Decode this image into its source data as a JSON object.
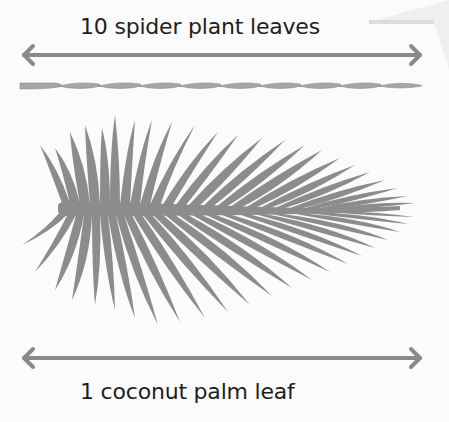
{
  "diagram": {
    "top": {
      "label": "10 spider plant leaves",
      "leaf_count": 10
    },
    "bottom": {
      "label": "1 coconut palm leaf",
      "leaf_count": 1
    },
    "colors": {
      "arrow": "#8a8a8a",
      "leaf": "#8c8c8c",
      "text": "#1e1e1e",
      "background": "#fbfbfb"
    }
  }
}
